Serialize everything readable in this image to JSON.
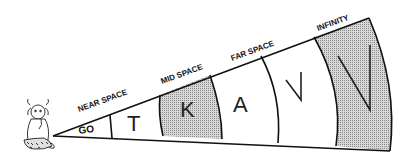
{
  "diagram": {
    "figure": "girl-sitting",
    "zones": [
      {
        "label": "NEAR SPACE",
        "letter": "GO",
        "shaded": false
      },
      {
        "label": "",
        "letter": "T",
        "shaded": false
      },
      {
        "label": "MID SPACE",
        "letter": "K",
        "shaded": true
      },
      {
        "label": "FAR SPACE",
        "letter": "A",
        "shaded": false
      },
      {
        "label": "",
        "letter": "V",
        "shaded": false
      },
      {
        "label": "INFINITY",
        "letter": "V",
        "shaded": true
      }
    ],
    "colors": {
      "line": "#111111",
      "shade": "#bdbdbd",
      "background": "#ffffff"
    }
  }
}
